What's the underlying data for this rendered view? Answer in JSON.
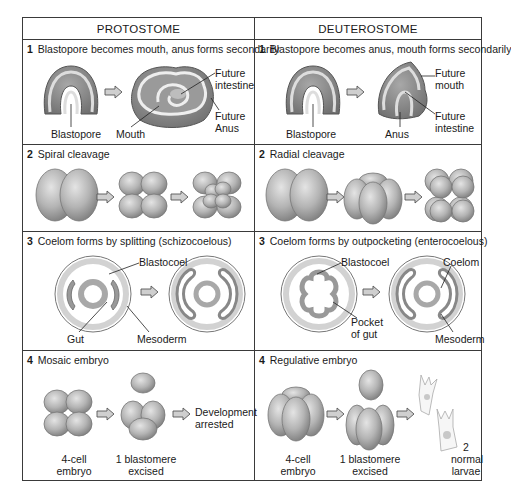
{
  "columns": [
    {
      "title": "PROTOSTOME"
    },
    {
      "title": "DEUTEROSTOME"
    }
  ],
  "rows": [
    {
      "protostome": {
        "number": "1",
        "heading": "Blastopore becomes mouth, anus forms secondarily",
        "labels": {
          "blastopore": "Blastopore",
          "mouth": "Mouth",
          "future_intestine_1": "Future",
          "future_intestine_2": "intestine",
          "future_anus_1": "Future",
          "future_anus_2": "Anus"
        }
      },
      "deuterostome": {
        "number": "1",
        "heading": "Blastopore becomes anus, mouth forms secondarily",
        "labels": {
          "blastopore": "Blastopore",
          "anus": "Anus",
          "future_mouth_1": "Future",
          "future_mouth_2": "mouth",
          "future_intestine_1": "Future",
          "future_intestine_2": "intestine"
        }
      }
    },
    {
      "protostome": {
        "number": "2",
        "heading": "Spiral cleavage"
      },
      "deuterostome": {
        "number": "2",
        "heading": "Radial cleavage"
      }
    },
    {
      "protostome": {
        "number": "3",
        "heading": "Coelom forms by splitting (schizocoelous)",
        "labels": {
          "blastocoel": "Blastocoel",
          "gut": "Gut",
          "mesoderm": "Mesoderm"
        }
      },
      "deuterostome": {
        "number": "3",
        "heading": "Coelom forms by outpocketing (enterocoelous)",
        "labels": {
          "blastocoel": "Blastocoel",
          "coelom": "Coelom",
          "pocket_1": "Pocket",
          "pocket_2": "of gut",
          "mesoderm": "Mesoderm"
        }
      }
    },
    {
      "protostome": {
        "number": "4",
        "heading": "Mosaic embryo",
        "labels": {
          "four_cell_1": "4-cell",
          "four_cell_2": "embryo",
          "excised_1": "1 blastomere",
          "excised_2": "excised",
          "result_1": "Development",
          "result_2": "arrested"
        }
      },
      "deuterostome": {
        "number": "4",
        "heading": "Regulative embryo",
        "labels": {
          "four_cell_1": "4-cell",
          "four_cell_2": "embryo",
          "excised_1": "1 blastomere",
          "excised_2": "excised",
          "result_1": "2",
          "result_2": "normal",
          "result_3": "larvae"
        }
      }
    }
  ],
  "colors": {
    "border": "#3a3a3a",
    "cell_fill": "#b8b8b8",
    "cell_shadow": "#8a8a8a",
    "arrow_fill": "#c8c8c8"
  }
}
